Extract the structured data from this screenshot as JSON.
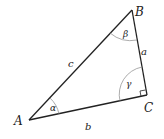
{
  "diagram": {
    "vertices": {
      "A": "A",
      "B": "B",
      "C": "C"
    },
    "sides": {
      "a": "a",
      "b": "b",
      "c": "c"
    },
    "angles": {
      "alpha": "α",
      "beta": "β",
      "gamma": "γ"
    },
    "right_angle_at": "C",
    "colors": {
      "stroke": "#222222",
      "arc": "#777777",
      "background": "#ffffff"
    }
  }
}
